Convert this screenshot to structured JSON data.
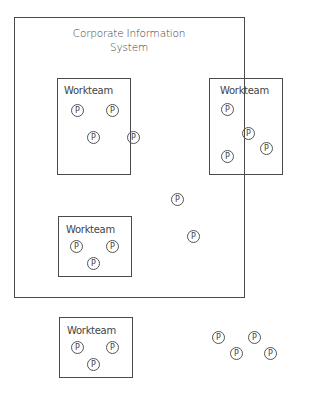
{
  "diagram": {
    "title": "Corporate Information System",
    "title_line1": "Corporate Information",
    "title_line2": "System",
    "outer_box": {
      "x": 14,
      "y": 17,
      "w": 231,
      "h": 281
    },
    "workteams": [
      {
        "label": "Workteam",
        "x": 57,
        "y": 78,
        "w": 74,
        "h": 97,
        "label_x": 64,
        "label_y": 85
      },
      {
        "label": "Workteam",
        "x": 209,
        "y": 78,
        "w": 74,
        "h": 97,
        "label_x": 220,
        "label_y": 85
      },
      {
        "label": "Workteam",
        "x": 58,
        "y": 216,
        "w": 74,
        "h": 61,
        "label_x": 66,
        "label_y": 224
      },
      {
        "label": "Workteam",
        "x": 59,
        "y": 317,
        "w": 74,
        "h": 61,
        "label_x": 67,
        "label_y": 325
      }
    ],
    "person_label": "P",
    "persons": [
      {
        "x": 77,
        "y": 110
      },
      {
        "x": 112,
        "y": 110
      },
      {
        "x": 93,
        "y": 137
      },
      {
        "x": 133,
        "y": 137
      },
      {
        "x": 227,
        "y": 109
      },
      {
        "x": 248,
        "y": 133
      },
      {
        "x": 266,
        "y": 148
      },
      {
        "x": 227,
        "y": 156
      },
      {
        "x": 177,
        "y": 199
      },
      {
        "x": 193,
        "y": 236
      },
      {
        "x": 76,
        "y": 246
      },
      {
        "x": 112,
        "y": 246
      },
      {
        "x": 93,
        "y": 263
      },
      {
        "x": 77,
        "y": 347
      },
      {
        "x": 112,
        "y": 347
      },
      {
        "x": 93,
        "y": 364
      },
      {
        "x": 218,
        "y": 337
      },
      {
        "x": 254,
        "y": 337
      },
      {
        "x": 236,
        "y": 353
      },
      {
        "x": 270,
        "y": 353
      }
    ]
  }
}
